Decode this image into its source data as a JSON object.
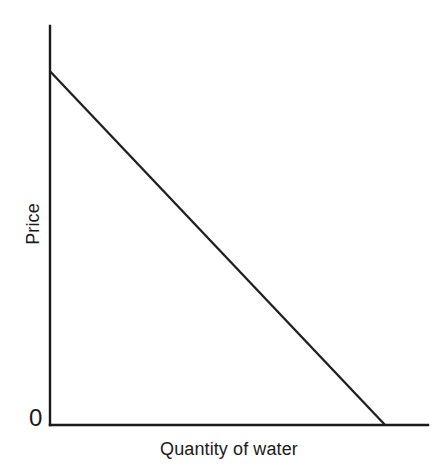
{
  "chart_data": {
    "type": "line",
    "title": "",
    "subtitle": "",
    "xlabel": "Quantity of water",
    "ylabel": "Price",
    "origin_label": "0",
    "grid": false,
    "legend": false,
    "legend_position": "none",
    "xlim": [
      0,
      1.128
    ],
    "ylim": [
      0,
      1.0
    ],
    "x_tick_labels": [],
    "y_tick_labels": [
      "0"
    ],
    "annotations": [],
    "series": [
      {
        "name": "Demand",
        "type": "line",
        "color": "#1f1f1f",
        "x": [
          0,
          1
        ],
        "y": [
          1,
          0
        ],
        "description": "Downward-sloping straight-line demand curve from the price intercept on the vertical axis to the quantity intercept on the horizontal axis"
      }
    ],
    "axes": {
      "y_axis": {
        "name": "price-axis",
        "orientation": "vertical",
        "arrow": false,
        "extends_above_curve": true
      },
      "x_axis": {
        "name": "quantity-axis",
        "orientation": "horizontal",
        "arrow": false,
        "extends_beyond_curve": true
      }
    }
  },
  "figure": {
    "background_color": "#ffffff",
    "line_color": "#1f1f1f",
    "axis_color": "#1a1a1a",
    "text_color": "#1a1a1a"
  }
}
